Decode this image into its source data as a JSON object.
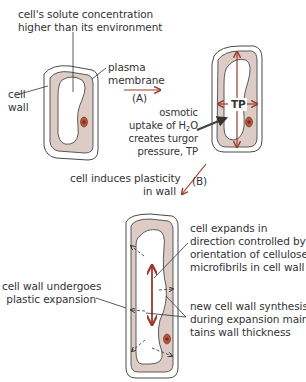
{
  "diagram": {
    "colors": {
      "cytoplasm": "#ddcbc6",
      "outline": "#4a4a4a",
      "arrow": "#9b3a2a",
      "nucleus": "#9b3a22",
      "background": "#ffffff"
    },
    "labels": {
      "solute_line1": "cell's solute concentration",
      "solute_line2": "higher than its environment",
      "plasma_line1": "plasma",
      "plasma_line2": "membrane",
      "cell_wall_line1": "cell",
      "cell_wall_line2": "wall",
      "step_a": "(A)",
      "osmotic_line1": "osmotic",
      "osmotic_line2_pre": "uptake of H",
      "osmotic_line2_sub": "2",
      "osmotic_line2_post": "O",
      "osmotic_line3": "creates turgor",
      "osmotic_line4": "pressure, TP",
      "tp": "TP",
      "plasticity_line1": "cell induces plasticity",
      "plasticity_line2": "in wall",
      "step_b": "(B)",
      "expands_line1": "cell expands in",
      "expands_line2": "direction controlled by",
      "expands_line3": "orientation of cellulose",
      "expands_line4": "microfibrils in cell wall",
      "wall_exp_line1": "cell wall undergoes",
      "wall_exp_line2": "plastic expansion",
      "synth_line1": "new cell wall synthesis",
      "synth_line2": "during expansion main-",
      "synth_line3": "tains wall thickness"
    }
  }
}
